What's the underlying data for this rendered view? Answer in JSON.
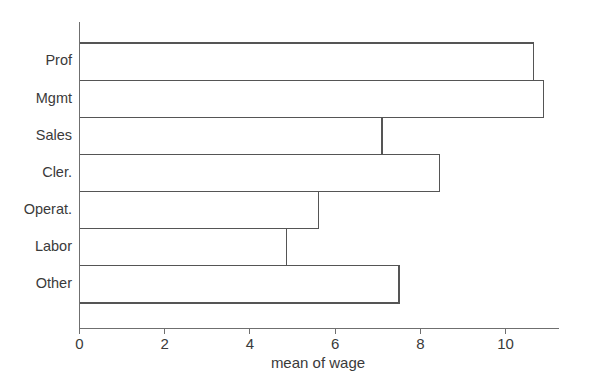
{
  "chart_data": {
    "type": "bar",
    "orientation": "horizontal",
    "title": "",
    "xlabel": "mean of wage",
    "ylabel": "",
    "categories": [
      "Prof",
      "Mgmt",
      "Sales",
      "Cler.",
      "Operat.",
      "Labor",
      "Other"
    ],
    "values": [
      10.65,
      10.9,
      7.1,
      8.45,
      5.6,
      4.85,
      7.5
    ],
    "xlim": [
      0,
      11.25
    ],
    "xticks": [
      0,
      2,
      4,
      6,
      8,
      10
    ],
    "xticklabels": [
      "0",
      "2",
      "4",
      "6",
      "8",
      "10"
    ],
    "grid": false,
    "legend": null,
    "bar_fill": "none",
    "bar_stroke": "#555555",
    "axis_color": "#6f6f6f",
    "background": "#ffffff",
    "text_color": "#3a3a3a"
  },
  "axis": {
    "x_title": "mean of wage",
    "tick_labels": [
      "0",
      "2",
      "4",
      "6",
      "8",
      "10"
    ],
    "category_labels": [
      "Prof",
      "Mgmt",
      "Sales",
      "Cler.",
      "Operat.",
      "Labor",
      "Other"
    ]
  }
}
